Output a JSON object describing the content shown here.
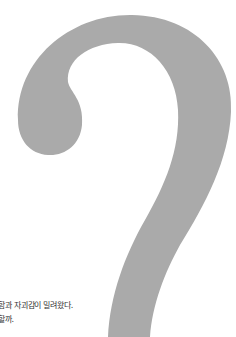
{
  "illustration": {
    "name": "question-mark",
    "color": "#aaaaaa"
  },
  "caption": {
    "lines": [
      "함과 자괴감이 밀려왔다.",
      "할까."
    ]
  }
}
